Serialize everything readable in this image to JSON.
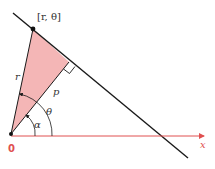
{
  "diagram": {
    "labels": {
      "point": "[r, θ]",
      "r": "r",
      "p": "p",
      "theta": "θ",
      "alpha": "α",
      "origin": "0",
      "x_axis": "x"
    },
    "colors": {
      "line": "#1a1a1a",
      "triangle_fill": "#f4b6b6",
      "triangle_stroke": "#1a1a1a",
      "axis": "#e05050",
      "origin_label": "#e05050",
      "text": "#333333"
    },
    "geometry": {
      "origin": [
        11,
        134
      ],
      "point": [
        33,
        29
      ],
      "foot": [
        69,
        62
      ],
      "line_start": [
        13,
        13
      ],
      "line_end": [
        188,
        158
      ],
      "axis_end": [
        205,
        136
      ]
    }
  }
}
